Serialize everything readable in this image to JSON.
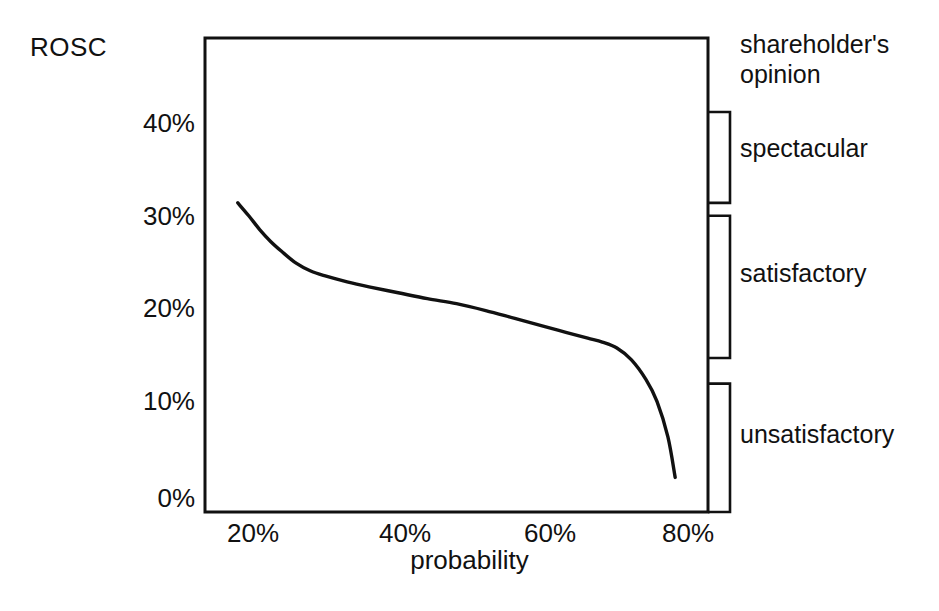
{
  "chart_data": {
    "type": "line",
    "title": "",
    "ylabel": "ROSC",
    "xlabel": "probability",
    "xtick_labels": [
      "20%",
      "40%",
      "60%",
      "80%"
    ],
    "xtick_values": [
      20,
      40,
      60,
      80
    ],
    "ytick_labels": [
      "0%",
      "10%",
      "20%",
      "30%",
      "40%"
    ],
    "ytick_values": [
      0,
      10,
      20,
      30,
      40
    ],
    "xlim": [
      13.5,
      82.5
    ],
    "ylim": [
      0,
      48
    ],
    "grid": false,
    "legend_position": "right",
    "series": [
      {
        "name": "ROSC vs probability",
        "x": [
          18.0,
          19.5,
          21.0,
          22.5,
          24.0,
          26.0,
          28.0,
          30.0,
          33.0,
          36.0,
          40.0,
          44.0,
          48.0,
          52.0,
          56.0,
          60.0,
          63.0,
          66.0,
          68.0,
          70.0,
          72.0,
          74.0,
          75.5,
          77.0,
          78.0
        ],
        "y": [
          31.3,
          30.0,
          28.6,
          27.4,
          26.4,
          25.2,
          24.4,
          23.9,
          23.3,
          22.8,
          22.2,
          21.6,
          21.1,
          20.4,
          19.6,
          18.8,
          18.2,
          17.6,
          17.2,
          16.6,
          15.4,
          13.4,
          11.2,
          7.6,
          3.5
        ]
      }
    ],
    "annotations": {
      "legend_heading": "shareholder's opinion",
      "bands": [
        {
          "label": "spectacular",
          "y_top": 40.5,
          "y_bottom": 31.3
        },
        {
          "label": "satisfactory",
          "y_top": 30.0,
          "y_bottom": 15.6
        },
        {
          "label": "unsatisfactory",
          "y_top": 13.0,
          "y_bottom": 0.0
        }
      ]
    }
  },
  "axes": {
    "y_title": "ROSC",
    "x_title": "probability",
    "y_ticks": [
      "40%",
      "30%",
      "20%",
      "10%",
      "0%"
    ],
    "x_ticks": [
      "20%",
      "40%",
      "60%",
      "80%"
    ]
  },
  "legend": {
    "heading_line1": "shareholder's",
    "heading_line2": "opinion",
    "heading": "shareholder's opinion",
    "items": [
      {
        "label": "spectacular"
      },
      {
        "label": "satisfactory"
      },
      {
        "label": "unsatisfactory"
      }
    ]
  },
  "colors": {
    "ink": "#111111",
    "background": "#ffffff"
  }
}
